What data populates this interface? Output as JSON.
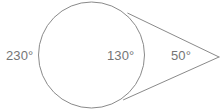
{
  "figure": {
    "kind": "geometry-diagram",
    "background_color": "#ffffff",
    "stroke_color": "#8a8a8a",
    "text_color": "#757575",
    "stroke_width": 1,
    "width": 224,
    "height": 112
  },
  "circle": {
    "center_x": 91.5,
    "center_y": 55,
    "radius": 53
  },
  "external_point": {
    "x": 219,
    "y": 57
  },
  "tangents": [
    {
      "name": "upper-tangent",
      "from_x": 127.8,
      "from_y": 13.2,
      "to_x": 219,
      "to_y": 57
    },
    {
      "name": "lower-tangent",
      "from_x": 123.5,
      "from_y": 99.8,
      "to_x": 219,
      "to_y": 57
    }
  ],
  "labels": {
    "major_arc": "230°",
    "minor_arc": "130°",
    "vertex_angle": "50°"
  }
}
